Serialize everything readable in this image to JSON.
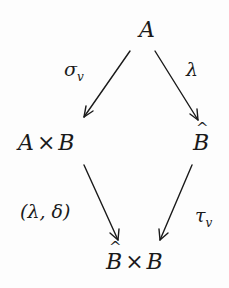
{
  "diagram": {
    "type": "commutative-diagram",
    "nodes": {
      "top": {
        "label": "A"
      },
      "left": {
        "left_part": "A",
        "times": "×",
        "right_part": "B"
      },
      "right": {
        "label": "B",
        "hat": true
      },
      "bottom": {
        "left_part": "B",
        "left_hat": true,
        "times": "×",
        "right_part": "B"
      }
    },
    "arrows": {
      "top_left": {
        "from": "A",
        "to": "A×B",
        "label_main": "σ",
        "label_sub": "v"
      },
      "top_right": {
        "from": "A",
        "to": "B̂",
        "label_main": "λ"
      },
      "bottom_left": {
        "from": "A×B",
        "to": "B̂×B",
        "label": "(λ, δ)"
      },
      "bottom_right": {
        "from": "B̂",
        "to": "B̂×B",
        "label_main": "τ",
        "label_sub": "v"
      }
    },
    "colors": {
      "ink": "#1a1a1a",
      "background": "#fdfdfd"
    }
  }
}
